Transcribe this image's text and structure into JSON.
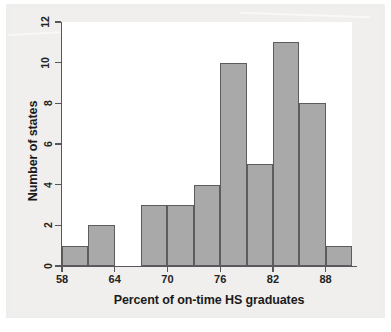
{
  "chart_data": {
    "type": "bar",
    "title": "",
    "subtitle": "",
    "xlabel": "Percent of on-time HS graduates",
    "ylabel": "Number of states",
    "bin_width": 3,
    "bin_edges": [
      58,
      61,
      64,
      67,
      70,
      73,
      76,
      79,
      82,
      85,
      88,
      91
    ],
    "categories": [
      "58-61",
      "61-64",
      "64-67",
      "67-70",
      "70-73",
      "73-76",
      "76-79",
      "79-82",
      "82-85",
      "85-88",
      "88-91"
    ],
    "values": [
      1,
      2,
      0,
      3,
      3,
      4,
      10,
      5,
      11,
      8,
      1
    ],
    "xlim": [
      58,
      91
    ],
    "ylim": [
      0,
      12
    ],
    "xticks": [
      58,
      64,
      70,
      76,
      82,
      88
    ],
    "yticks": [
      0,
      2,
      4,
      6,
      8,
      10,
      12
    ],
    "xtick_labels": [
      "58",
      "64",
      "70",
      "76",
      "82",
      "88"
    ],
    "ytick_labels": [
      "0",
      "2",
      "4",
      "6",
      "8",
      "10",
      "12"
    ],
    "grid": false,
    "legend": false,
    "legend_position": "none",
    "bar_fill_color": "#a9a9a9",
    "bar_edge_color": "#5c5c5e",
    "axis_color": "#58585a",
    "plot_background": "#ffffff",
    "page_background": "#f0efed",
    "annotations": []
  }
}
